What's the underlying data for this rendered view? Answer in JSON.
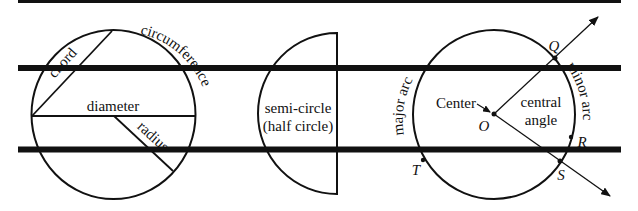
{
  "colors": {
    "stroke": "#111111",
    "background": "#ffffff"
  },
  "guide_lines": [
    {
      "name": "top-guide-line",
      "y": 1,
      "thickness": 3
    },
    {
      "name": "upper-thick-line",
      "y": 68,
      "thickness": 6
    },
    {
      "name": "lower-thick-line",
      "y": 149.5,
      "thickness": 6
    }
  ],
  "circle_parts": {
    "chord": "chord",
    "circumference": "circumference",
    "diameter": "diameter",
    "radius": "radius"
  },
  "semicircle": {
    "line1": "semi-circle",
    "line2": "(half circle)"
  },
  "arcs_angles": {
    "major_arc": "major arc",
    "minor_arc": "minor arc",
    "center": "Center",
    "central_angle_line1": "central",
    "central_angle_line2": "angle",
    "points": {
      "O": "O",
      "Q": "Q",
      "R": "R",
      "S": "S",
      "T": "T"
    }
  }
}
